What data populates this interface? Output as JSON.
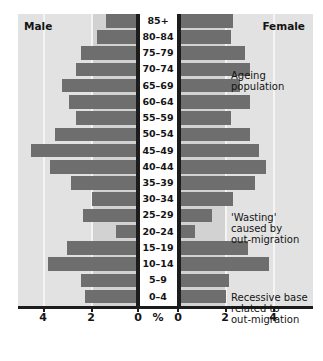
{
  "chart_data": {
    "type": "bar",
    "subtype": "population-pyramid",
    "title": "",
    "xlabel": "%",
    "ylabel": "",
    "categories": [
      "0–4",
      "5–9",
      "10–14",
      "15–19",
      "20–24",
      "25–29",
      "30–34",
      "35–39",
      "40–44",
      "45–49",
      "50–54",
      "55–59",
      "60–64",
      "65–69",
      "70–74",
      "75–79",
      "80–84",
      "85+"
    ],
    "series": [
      {
        "name": "Male",
        "values": [
          2.2,
          2.4,
          3.8,
          3.0,
          0.9,
          2.3,
          1.9,
          2.8,
          3.7,
          4.5,
          3.5,
          2.6,
          2.9,
          3.2,
          2.6,
          2.4,
          1.7,
          1.3
        ]
      },
      {
        "name": "Female",
        "values": [
          2.1,
          2.2,
          3.9,
          3.0,
          0.75,
          1.5,
          2.4,
          3.3,
          3.8,
          3.5,
          3.1,
          2.3,
          3.1,
          2.7,
          3.1,
          2.9,
          2.3,
          2.4
        ]
      }
    ],
    "xlim": [
      0,
      5
    ],
    "xticks": [
      0,
      2,
      4
    ],
    "xticklabels_left": [
      "4",
      "2",
      "0"
    ],
    "xticklabels_right": [
      "0",
      "2",
      "4"
    ],
    "grid": true,
    "legend": "none",
    "bar_color": "#6e6e6e",
    "panel_color": "#dcdcdc"
  },
  "headers": {
    "male": "Male",
    "female": "Female"
  },
  "axis": {
    "unit_label": "%",
    "left_ticks": [
      "4",
      "2",
      "0"
    ],
    "right_ticks": [
      "0",
      "2",
      "4"
    ]
  },
  "annotations": {
    "ageing": "Ageing\npopulation",
    "ageing_line1": "Ageing",
    "ageing_line2": "population",
    "wasting_line1": "'Wasting'",
    "wasting_line2": "caused by",
    "wasting_line3": "out-migration",
    "recessive_line1": "Recessive base",
    "recessive_line2": "related to",
    "recessive_line3": "out-migration"
  }
}
